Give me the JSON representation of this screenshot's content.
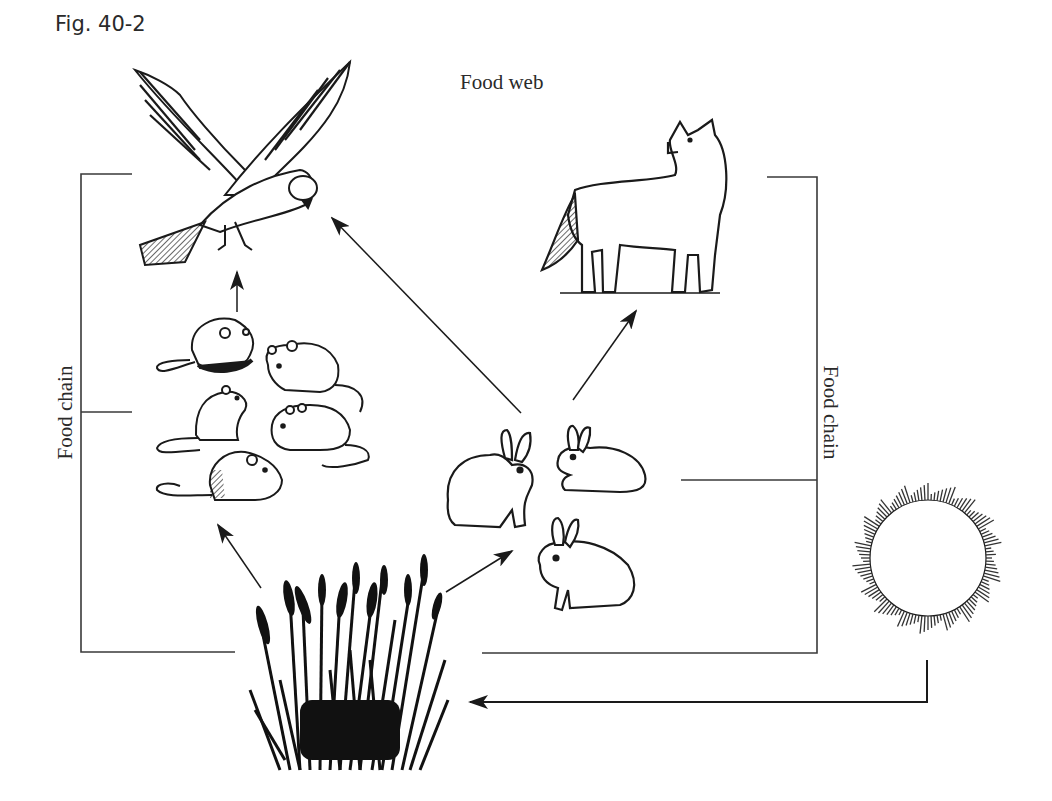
{
  "figure": {
    "label": "Fig. 40-2",
    "title": "Food web"
  },
  "side_labels": {
    "left": "Food chain",
    "right": "Food chain"
  },
  "organisms": [
    {
      "id": "hawk",
      "name": "Hawk",
      "role": "tertiary consumer"
    },
    {
      "id": "fox",
      "name": "Fox",
      "role": "secondary consumer"
    },
    {
      "id": "mice",
      "name": "Mice",
      "count": 5,
      "role": "primary consumer"
    },
    {
      "id": "rabbits",
      "name": "Rabbits",
      "count": 3,
      "role": "primary consumer"
    },
    {
      "id": "grass",
      "name": "Grass",
      "role": "producer"
    },
    {
      "id": "sun",
      "name": "Sun",
      "role": "energy source"
    }
  ],
  "arrows": [
    {
      "from": "mice",
      "to": "hawk"
    },
    {
      "from": "rabbits",
      "to": "hawk"
    },
    {
      "from": "rabbits",
      "to": "fox"
    },
    {
      "from": "grass",
      "to": "mice"
    },
    {
      "from": "grass",
      "to": "rabbits"
    },
    {
      "from": "sun",
      "to": "grass"
    }
  ],
  "colors": {
    "ink": "#1a1a1a",
    "line": "#333333",
    "background": "#ffffff"
  }
}
